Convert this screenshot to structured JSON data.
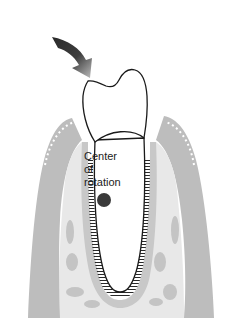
{
  "diagram": {
    "label_lines": [
      "Center",
      "of",
      "rotation"
    ],
    "colors": {
      "bone": "#bdbdbd",
      "bone_light": "#e6e6e6",
      "outline": "#1a1a1a",
      "center_dot": "#3a3a3a",
      "arrow_dark": "#2a2a2a",
      "arrow_light": "#bbbbbb"
    }
  }
}
